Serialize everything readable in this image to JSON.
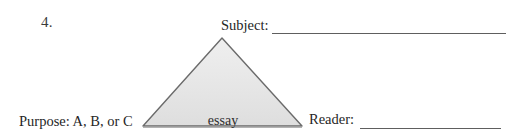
{
  "figure": {
    "item_number": "4.",
    "background_color": "#ffffff"
  },
  "fields": {
    "subject": {
      "label": "Subject:",
      "value": "",
      "line_color": "#5e5e5e"
    },
    "purpose": {
      "label": "Purpose: A, B, or C"
    },
    "reader": {
      "label": "Reader:",
      "value": "",
      "line_color": "#5e5e5e"
    }
  },
  "diagram": {
    "shape": "triangle",
    "center_label": "essay",
    "fill_color": "#e4e4e4",
    "fill_color_top": "#efefef",
    "stroke_color": "#6b6b6b",
    "base_shadow_color": "#9a9a9a",
    "vertices": {
      "apex": [
        222,
        38
      ],
      "bottom_left": [
        143,
        126
      ],
      "bottom_right": [
        302,
        126
      ]
    }
  }
}
